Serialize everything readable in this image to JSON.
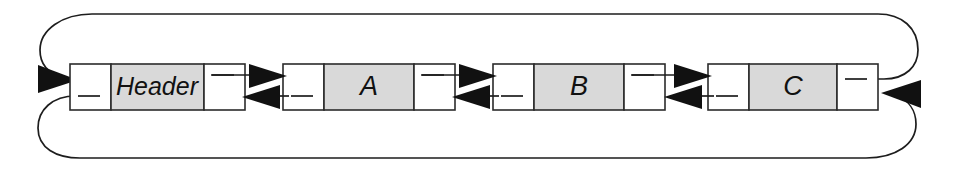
{
  "diagram": {
    "type": "linked-list",
    "canvas": {
      "width": 960,
      "height": 170
    },
    "colors": {
      "background": "#ffffff",
      "node_fill_shaded": "#d9d9d9",
      "node_fill_plain": "#ffffff",
      "stroke": "#1d1d1d",
      "arrow_fill": "#111111"
    },
    "nodes": [
      {
        "id": "header",
        "label": "Header",
        "kind": "header",
        "x": 70,
        "y": 64,
        "width": 175,
        "height": 46,
        "prev_cell_width": 41,
        "next_cell_width": 41
      },
      {
        "id": "node-a",
        "label": "A",
        "kind": "data",
        "x": 283,
        "y": 64,
        "width": 172,
        "height": 46,
        "prev_cell_width": 41,
        "next_cell_width": 41
      },
      {
        "id": "node-b",
        "label": "B",
        "kind": "data",
        "x": 493,
        "y": 64,
        "width": 172,
        "height": 46,
        "prev_cell_width": 41,
        "next_cell_width": 41
      },
      {
        "id": "node-c",
        "label": "C",
        "kind": "data",
        "x": 708,
        "y": 64,
        "width": 170,
        "height": 46,
        "prev_cell_width": 41,
        "next_cell_width": 41
      }
    ],
    "links": [
      {
        "id": "next-header-a",
        "from": "header",
        "to": "node-a",
        "direction": "forward",
        "track": "upper"
      },
      {
        "id": "prev-a-header",
        "from": "node-a",
        "to": "header",
        "direction": "backward",
        "track": "lower"
      },
      {
        "id": "next-a-b",
        "from": "node-a",
        "to": "node-b",
        "direction": "forward",
        "track": "upper"
      },
      {
        "id": "prev-b-a",
        "from": "node-b",
        "to": "node-a",
        "direction": "backward",
        "track": "lower"
      },
      {
        "id": "next-b-c",
        "from": "node-b",
        "to": "node-c",
        "direction": "forward",
        "track": "upper"
      },
      {
        "id": "prev-c-b",
        "from": "node-c",
        "to": "node-b",
        "direction": "backward",
        "track": "lower"
      },
      {
        "id": "next-c-header",
        "from": "node-c",
        "to": "header",
        "direction": "forward",
        "track": "wrap-top"
      },
      {
        "id": "prev-header-c",
        "from": "header",
        "to": "node-c",
        "direction": "backward",
        "track": "wrap-bottom"
      }
    ]
  }
}
